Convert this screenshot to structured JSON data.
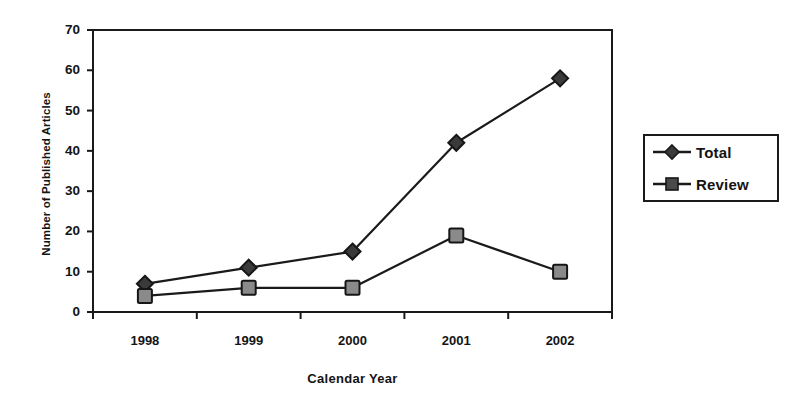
{
  "chart_data": {
    "type": "line",
    "title": "",
    "xlabel": "Calendar Year",
    "ylabel": "Number of Published Articles",
    "categories": [
      "1998",
      "1999",
      "2000",
      "2001",
      "2002"
    ],
    "series": [
      {
        "name": "Total",
        "marker": "diamond",
        "marker_color": "#3a3a3a",
        "line_color": "#1a1a1a",
        "values": [
          7,
          11,
          15,
          42,
          58
        ]
      },
      {
        "name": "Review",
        "marker": "square",
        "marker_color": "#8a8a8a",
        "line_color": "#1a1a1a",
        "values": [
          4,
          6,
          6,
          19,
          10
        ]
      }
    ],
    "ylim": [
      0,
      70
    ],
    "y_ticks": [
      0,
      10,
      20,
      30,
      40,
      50,
      60,
      70
    ],
    "y_tick_labels": [
      "0",
      "10",
      "20",
      "30",
      "40",
      "50",
      "60",
      "70"
    ],
    "grid": false,
    "legend_position": "right",
    "legend_entries": [
      "Total",
      "Review"
    ],
    "frame": "full-box"
  },
  "legend": {
    "items": [
      {
        "label": "Total",
        "marker": "diamond-marker"
      },
      {
        "label": "Review",
        "marker": "square-marker"
      }
    ]
  },
  "axes": {
    "x_title": "Calendar Year",
    "y_title": "Number of Published Articles"
  }
}
